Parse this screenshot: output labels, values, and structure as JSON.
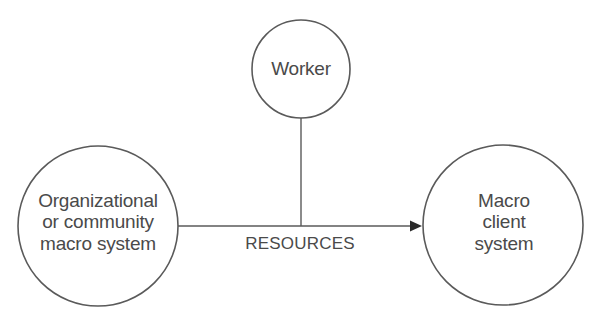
{
  "diagram": {
    "type": "relationship-diagram",
    "stroke_color": "#5a5a5a",
    "text_color": "#4a4a4a",
    "nodes": {
      "org": {
        "lines": [
          "Organizational",
          "or community",
          "macro system"
        ]
      },
      "worker": {
        "lines": [
          "Worker"
        ]
      },
      "client": {
        "lines": [
          "Macro",
          "client",
          "system"
        ]
      }
    },
    "edges": {
      "resources": {
        "label": "RESOURCES",
        "from": "Organizational or community macro system",
        "to": "Macro client system",
        "arrow": "right"
      },
      "worker_link": {
        "from": "Worker",
        "to": "RESOURCES line"
      }
    }
  }
}
